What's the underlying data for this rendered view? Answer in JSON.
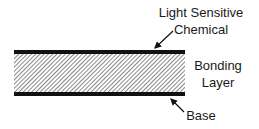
{
  "diagram": {
    "labels": {
      "top_line1": "Light Sensitive",
      "top_line2": "Chemical",
      "middle_line1": "Bonding",
      "middle_line2": "Layer",
      "bottom": "Base"
    },
    "colors": {
      "bar": "#111111",
      "hatch": "#555555",
      "background": "#ffffff"
    }
  }
}
